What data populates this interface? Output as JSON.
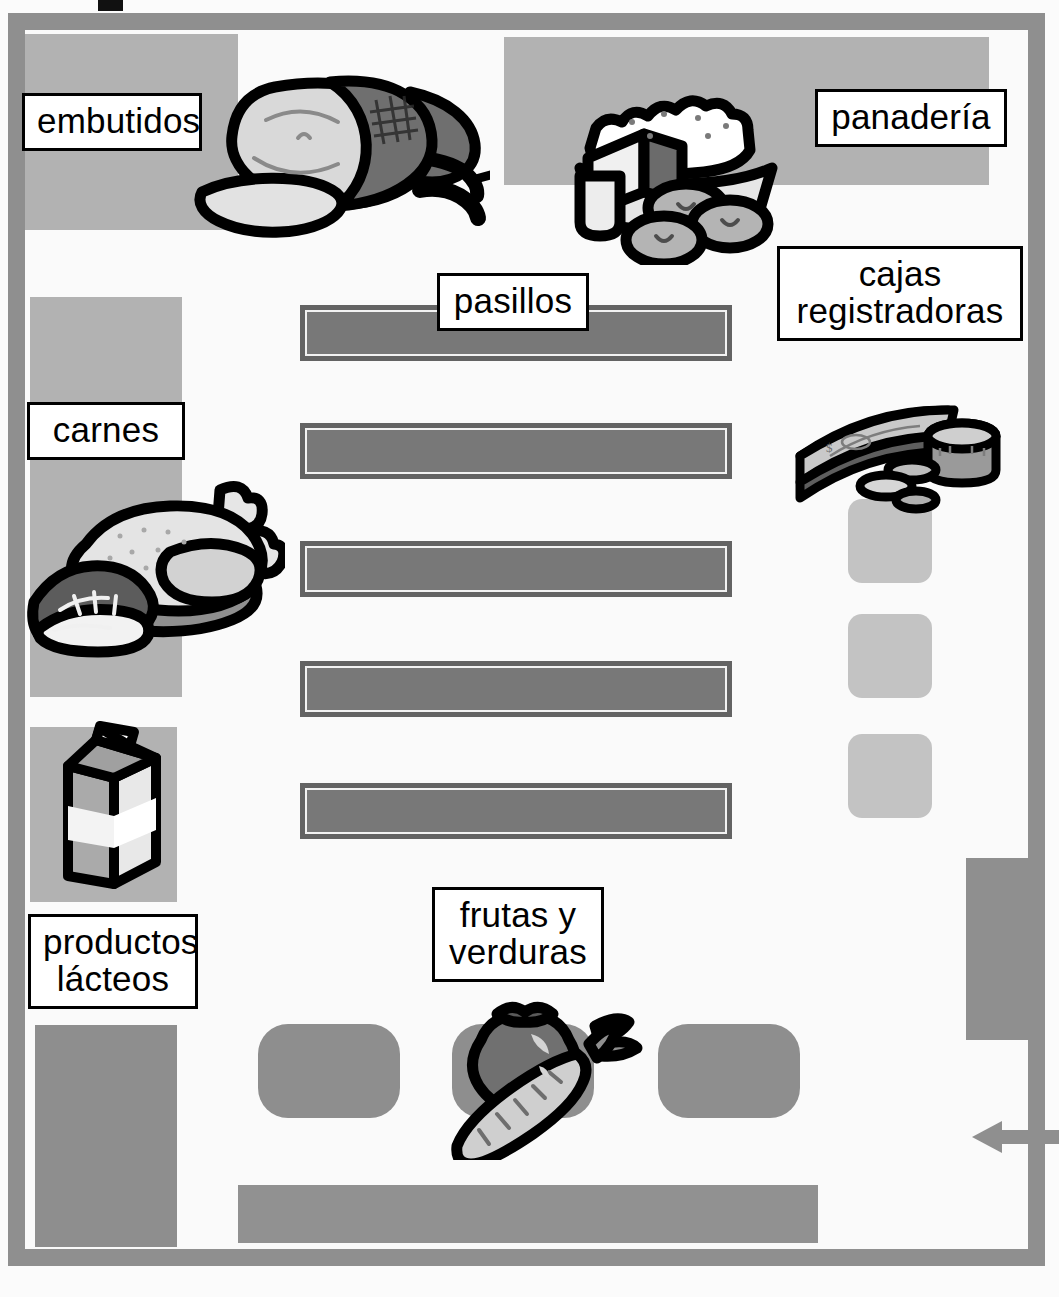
{
  "diagram": {
    "language": "es",
    "type": "store-floor-plan"
  },
  "labels": {
    "deli": "embutidos",
    "bakery": "panadería",
    "aisles": "pasillos",
    "registers": "cajas\nregistradoras",
    "meat": "carnes",
    "dairy": "productos\nlácteos",
    "produce": "frutas y\nverduras"
  },
  "icons": {
    "deli": "ham-icon",
    "bakery": "pie-icon",
    "registers": "money-icon",
    "meat": "meat-icon",
    "dairy": "milk-carton-icon",
    "produce": "vegetables-icon",
    "entrance": "left-arrow-icon"
  },
  "fixtures": {
    "aisle_count": 5,
    "register_count": 3,
    "produce_bin_count": 3
  },
  "colors": {
    "wall": "#8f8f8f",
    "floor": "#fafafa",
    "department_backdrop": "#b2b2b2",
    "aisle_fill": "#787878",
    "aisle_border": "#636363",
    "fixture_gray": "#8e8e8e",
    "register_gray": "#c3c3c3",
    "label_bg": "#ffffff",
    "label_border": "#000000"
  }
}
